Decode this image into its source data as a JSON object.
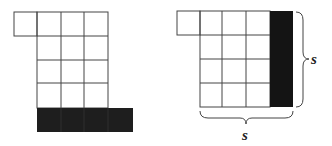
{
  "figures": [
    {
      "name": "left-figure",
      "description": "Grid arrangement with top-left extra square and shaded bottom row strip",
      "shaded_color": "#1e1e1e"
    },
    {
      "name": "right-figure",
      "description": "Square of side s with top-left extra square and shaded right column",
      "shaded_color": "#141414",
      "labels": {
        "side_right": "s",
        "side_bottom": "s"
      }
    }
  ],
  "colors": {
    "line": "#444444",
    "background": "#ffffff"
  }
}
